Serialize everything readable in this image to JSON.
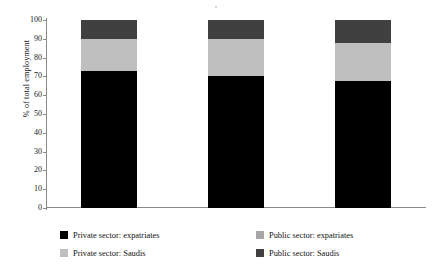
{
  "chart_data": {
    "type": "bar",
    "subtype": "stacked-bar",
    "title": "",
    "xlabel": "",
    "ylabel": "% of total employment",
    "categories": [
      "2017",
      "2018",
      "2019"
    ],
    "ylim": [
      0,
      100
    ],
    "ytick_labels": [
      "0",
      "10",
      "20",
      "30",
      "40",
      "50",
      "60",
      "70",
      "80",
      "90",
      "100"
    ],
    "ytick_values": [
      0,
      10,
      20,
      30,
      40,
      50,
      60,
      70,
      80,
      90,
      100
    ],
    "grid": false,
    "legend_position": "bottom",
    "stack_order_bottom_to_top": [
      "Private sector: expatriates",
      "Private sector: Saudis",
      "Public sector: expatriates",
      "Public sector: Saudis"
    ],
    "series": [
      {
        "name": "Private sector: expatriates",
        "color": "#000000",
        "values": [
          73,
          70,
          67.5
        ]
      },
      {
        "name": "Private sector: Saudis",
        "color": "#bfbfbf",
        "values": [
          17,
          20,
          20.5
        ]
      },
      {
        "name": "Public sector: expatriates",
        "color": "#a6a6a6",
        "values": [
          0,
          0,
          0
        ]
      },
      {
        "name": "Public sector: Saudis",
        "color": "#404040",
        "values": [
          10,
          10,
          12
        ]
      }
    ]
  },
  "axis": {
    "y_title": "% of total employment",
    "ticks": [
      {
        "label": "100",
        "value": 100
      },
      {
        "label": "90",
        "value": 90
      },
      {
        "label": "80",
        "value": 80
      },
      {
        "label": "70",
        "value": 70
      },
      {
        "label": "60",
        "value": 60
      },
      {
        "label": "50",
        "value": 50
      },
      {
        "label": "40",
        "value": 40
      },
      {
        "label": "30",
        "value": 30
      },
      {
        "label": "20",
        "value": 20
      },
      {
        "label": "10",
        "value": 10
      },
      {
        "label": "0",
        "value": 0
      }
    ]
  },
  "categories": [
    {
      "label": "2017"
    },
    {
      "label": "2018"
    },
    {
      "label": "2019"
    }
  ],
  "legend": {
    "items": [
      {
        "label": "Private sector: expatriates",
        "color": "#000000"
      },
      {
        "label": "Private sector: Saudis",
        "color": "#bfbfbf"
      },
      {
        "label": "Public sector: expatriates",
        "color": "#a6a6a6"
      },
      {
        "label": "Public sector: Saudis",
        "color": "#404040"
      }
    ]
  }
}
